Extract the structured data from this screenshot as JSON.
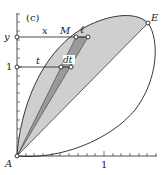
{
  "panel_label": "(c)",
  "colors": {
    "background": "#ffffff",
    "line": "#222222",
    "region_light": "#cfcfcf",
    "region_dark": "#9a9a9a"
  },
  "points": {
    "A": {
      "label": "A",
      "x": 17,
      "y": 156
    },
    "E": {
      "label": "E",
      "x": 148,
      "y": 23
    },
    "M": {
      "label": "M",
      "x": 76,
      "y": 37
    },
    "ell_end": {
      "label": "ℓ",
      "x": 88,
      "y": 37
    },
    "t_point": {
      "x": 61,
      "y": 67
    },
    "dt_point": {
      "label": "dt",
      "x": 71,
      "y": 67
    }
  },
  "axes": {
    "y_axis_labels": {
      "y": "y",
      "one": "1"
    },
    "x_axis_labels": {
      "one": "1"
    }
  },
  "segment_labels": {
    "x": "x",
    "t": "t",
    "M": "M",
    "ell": "ℓ",
    "dt": "dt",
    "E": "E",
    "A": "A"
  }
}
